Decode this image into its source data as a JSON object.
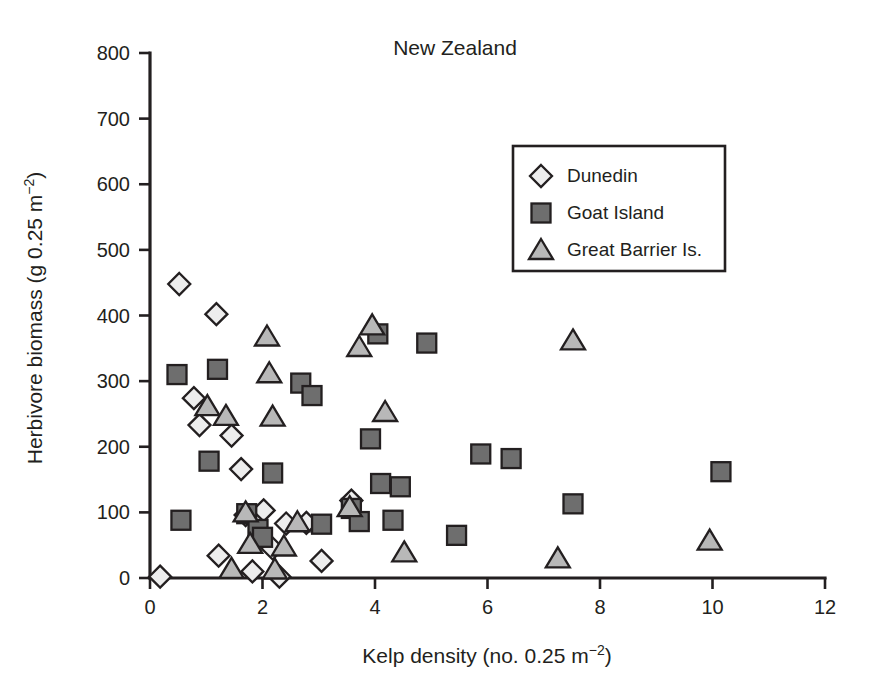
{
  "chart_data": {
    "type": "scatter",
    "title": "New Zealand",
    "xlabel": "Kelp density (no. 0.25 m",
    "xlabel_sup": "−2",
    "xlabel_tail": ")",
    "ylabel": "Herbivore biomass (g 0.25 m",
    "ylabel_sup": "−2",
    "ylabel_tail": ")",
    "xlim": [
      0,
      12
    ],
    "ylim": [
      0,
      800
    ],
    "xticks": [
      0,
      2,
      4,
      6,
      8,
      10,
      12
    ],
    "xtick_labels": [
      "0",
      "2",
      "4",
      "6",
      "8",
      "10",
      "12"
    ],
    "yticks": [
      0,
      100,
      200,
      300,
      400,
      500,
      600,
      700,
      800
    ],
    "ytick_labels": [
      "0",
      "100",
      "200",
      "300",
      "400",
      "500",
      "600",
      "700",
      "800"
    ],
    "grid": false,
    "legend_position": "upper-right",
    "colors": {
      "dunedin_fill": "#ededed",
      "goat_island_fill": "#6e6e6e",
      "great_barrier_fill": "#b8b8b8",
      "marker_stroke": "#231f20",
      "axis": "#231f20",
      "background": "#ffffff"
    },
    "series": [
      {
        "name": "Dunedin",
        "marker": "diamond",
        "fill": "#ededed",
        "points": [
          [
            0.18,
            2
          ],
          [
            0.52,
            448
          ],
          [
            0.78,
            274
          ],
          [
            0.88,
            233
          ],
          [
            1.18,
            402
          ],
          [
            1.22,
            34
          ],
          [
            1.45,
            217
          ],
          [
            1.62,
            166
          ],
          [
            1.7,
            96
          ],
          [
            1.82,
            10
          ],
          [
            1.95,
            64
          ],
          [
            2.02,
            103
          ],
          [
            2.18,
            45
          ],
          [
            2.3,
            2
          ],
          [
            2.42,
            83
          ],
          [
            2.78,
            84
          ],
          [
            3.05,
            26
          ],
          [
            3.58,
            118
          ]
        ]
      },
      {
        "name": "Goat Island",
        "marker": "square",
        "fill": "#6e6e6e",
        "points": [
          [
            0.48,
            310
          ],
          [
            0.55,
            88
          ],
          [
            1.05,
            178
          ],
          [
            1.2,
            318
          ],
          [
            1.72,
            98
          ],
          [
            1.92,
            74
          ],
          [
            2.0,
            62
          ],
          [
            2.18,
            160
          ],
          [
            2.68,
            297
          ],
          [
            2.88,
            278
          ],
          [
            3.05,
            82
          ],
          [
            3.58,
            106
          ],
          [
            3.72,
            86
          ],
          [
            3.92,
            212
          ],
          [
            4.05,
            372
          ],
          [
            4.1,
            144
          ],
          [
            4.32,
            88
          ],
          [
            4.45,
            139
          ],
          [
            4.92,
            358
          ],
          [
            5.45,
            65
          ],
          [
            5.88,
            189
          ],
          [
            6.42,
            182
          ],
          [
            7.52,
            113
          ],
          [
            10.15,
            162
          ]
        ]
      },
      {
        "name": "Great Barrier Is.",
        "marker": "triangle",
        "fill": "#b8b8b8",
        "points": [
          [
            1.02,
            262
          ],
          [
            1.35,
            247
          ],
          [
            1.45,
            14
          ],
          [
            1.7,
            100
          ],
          [
            1.78,
            52
          ],
          [
            2.08,
            368
          ],
          [
            2.12,
            312
          ],
          [
            2.18,
            246
          ],
          [
            2.22,
            13
          ],
          [
            2.38,
            48
          ],
          [
            2.62,
            85
          ],
          [
            3.55,
            108
          ],
          [
            3.72,
            352
          ],
          [
            3.95,
            385
          ],
          [
            4.18,
            253
          ],
          [
            4.52,
            39
          ],
          [
            7.25,
            30
          ],
          [
            7.52,
            362
          ],
          [
            9.95,
            57
          ]
        ]
      }
    ]
  },
  "legend": {
    "items": [
      {
        "label": "Dunedin",
        "marker": "diamond"
      },
      {
        "label": "Goat Island",
        "marker": "square"
      },
      {
        "label": "Great Barrier Is.",
        "marker": "triangle"
      }
    ]
  }
}
